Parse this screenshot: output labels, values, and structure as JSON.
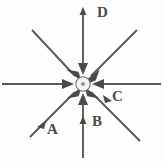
{
  "figure": {
    "background_color": "#fdfdfc",
    "stroke_color": "#5a5a5a",
    "center_dot_color": "#f2f2f2",
    "labels": [
      {
        "id": "A",
        "text": "A",
        "x": 47,
        "y": 122,
        "ray": "lower-left"
      },
      {
        "id": "B",
        "text": "B",
        "x": 92,
        "y": 114,
        "ray": "down"
      },
      {
        "id": "C",
        "text": "C",
        "x": 112,
        "y": 89,
        "ray": "lower-right"
      },
      {
        "id": "D",
        "text": "D",
        "x": 97,
        "y": 5,
        "ray": "up"
      }
    ],
    "center": {
      "x": 83,
      "y": 84,
      "radius": 7
    },
    "rays": [
      {
        "name": "up",
        "label": "D",
        "angle_deg": 90,
        "tail_x": 83,
        "tail_y": 10,
        "arrow_at_center": true
      },
      {
        "name": "upper-right",
        "label": "",
        "angle_deg": 45,
        "tail_x": 137,
        "tail_y": 30,
        "arrow_at_center": true
      },
      {
        "name": "right",
        "label": "",
        "angle_deg": 0,
        "tail_x": 160,
        "tail_y": 84,
        "arrow_at_center": true
      },
      {
        "name": "lower-right",
        "label": "C",
        "angle_deg": -45,
        "tail_x": 140,
        "tail_y": 141,
        "arrow_at_center": true
      },
      {
        "name": "down",
        "label": "B",
        "angle_deg": -90,
        "tail_x": 83,
        "tail_y": 158,
        "arrow_at_center": true
      },
      {
        "name": "lower-left",
        "label": "A",
        "angle_deg": -135,
        "tail_x": 30,
        "tail_y": 137,
        "arrow_at_center": true
      },
      {
        "name": "left",
        "label": "",
        "angle_deg": 180,
        "tail_x": 2,
        "tail_y": 84,
        "arrow_at_center": true
      },
      {
        "name": "upper-left",
        "label": "",
        "angle_deg": 135,
        "tail_x": 32,
        "tail_y": 30,
        "arrow_at_center": true
      }
    ]
  }
}
